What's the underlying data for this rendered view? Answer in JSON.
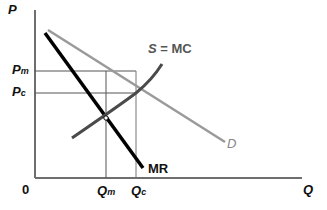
{
  "diagram": {
    "axes": {
      "y_label": "P",
      "x_label": "Q",
      "origin": "0"
    },
    "price_levels": [
      {
        "id": "pm",
        "label": "P",
        "subscript": "m"
      },
      {
        "id": "pc",
        "label": "P",
        "subscript": "c"
      }
    ],
    "quantity_levels": [
      {
        "id": "qm",
        "label": "Q",
        "subscript": "m"
      },
      {
        "id": "qc",
        "label": "Q",
        "subscript": "c"
      }
    ],
    "curves": [
      {
        "id": "supply",
        "label": "S = MC",
        "color": "#4a4a4a"
      },
      {
        "id": "demand",
        "label": "D",
        "color": "#9a9a9a"
      },
      {
        "id": "mr",
        "label": "MR",
        "color": "#000000"
      }
    ],
    "colors": {
      "axis": "#6e6e6e",
      "guide_lines": "#555555",
      "background": "#ffffff"
    }
  }
}
